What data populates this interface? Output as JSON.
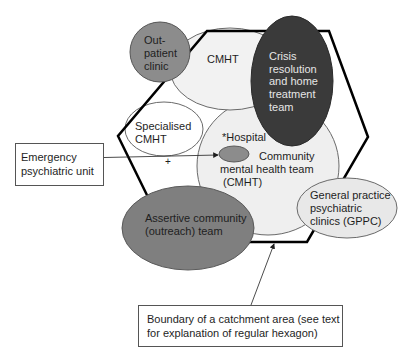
{
  "diagram": {
    "hexagon": {
      "label": "Boundary of a catchment area",
      "stroke": "#000000",
      "points": [
        [
          207,
          31
        ],
        [
          329,
          31
        ],
        [
          368,
          137
        ],
        [
          307,
          242
        ],
        [
          170,
          242
        ],
        [
          118,
          136
        ]
      ]
    },
    "nodes": {
      "outpatient": {
        "lines": [
          "Out-",
          "patient",
          "clinic"
        ],
        "fill": "#8c8c8c"
      },
      "cmht_top": {
        "lines": [
          "CMHT"
        ],
        "fill": "#efefef"
      },
      "crisis": {
        "lines": [
          "Crisis",
          "resolution",
          "and home",
          "treatment",
          "team"
        ],
        "fill": "#3a3a3a"
      },
      "specialised": {
        "lines": [
          "Specialised",
          "CMHT"
        ],
        "fill": "#ffffff"
      },
      "hospital": {
        "label": "*Hospital",
        "fill": "#8c8c8c"
      },
      "cmht_main": {
        "lines": [
          "Community",
          "mental health team",
          "(CMHT)"
        ],
        "fill": "#efefef"
      },
      "gppc": {
        "lines": [
          "General practice",
          "psychiatric",
          "clinics (GPPC)"
        ],
        "fill": "#e8e8e8"
      },
      "assertive": {
        "lines": [
          "Assertive community",
          "(outreach) team"
        ],
        "fill": "#7f7f7f"
      }
    },
    "plus_marker": "+",
    "callouts": {
      "emergency": {
        "lines": [
          "Emergency",
          "psychiatric unit"
        ]
      },
      "boundary": {
        "lines": [
          "Boundary of a catchment area (see text",
          "for explanation of regular hexagon)"
        ]
      }
    }
  }
}
